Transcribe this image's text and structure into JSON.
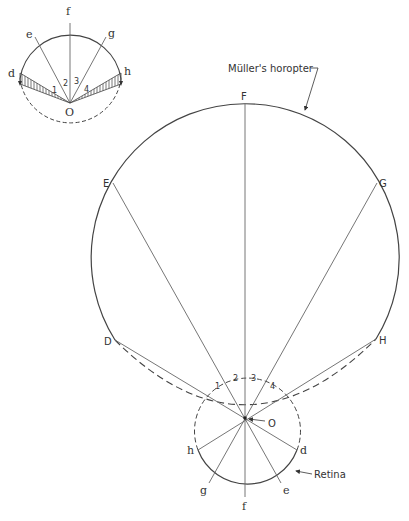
{
  "inset": {
    "labels": {
      "d": "d",
      "e": "e",
      "f": "f",
      "g": "g",
      "h": "h",
      "o": "O"
    },
    "numbers": [
      "1",
      "2",
      "3",
      "4"
    ]
  },
  "main": {
    "points": {
      "D": "D",
      "E": "E",
      "F": "F",
      "G": "G",
      "H": "H",
      "O": "O"
    },
    "retina_points": {
      "d": "d",
      "e": "e",
      "f": "f",
      "g": "g",
      "h": "h"
    },
    "numbers": [
      "1",
      "2",
      "3",
      "4"
    ],
    "horopter_label": "Müller's horopter",
    "retina_label": "Retina"
  },
  "colors": {
    "line": "#444444",
    "thin": "#666666",
    "background": "#ffffff"
  }
}
